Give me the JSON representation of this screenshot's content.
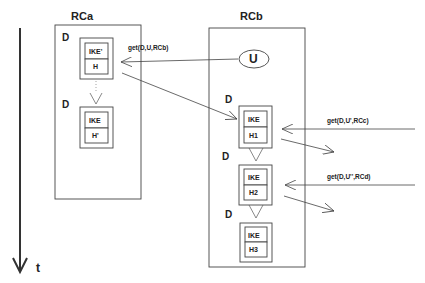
{
  "diagram": {
    "time_axis": {
      "label": "t"
    },
    "containers": [
      {
        "id": "RCa",
        "title": "RCa",
        "blocks": [
          {
            "d_label": "D",
            "top": "IKE'",
            "bottom": "H"
          },
          {
            "d_label": "D",
            "top": "IKE",
            "bottom": "H'"
          }
        ]
      },
      {
        "id": "RCb",
        "title": "RCb",
        "node": {
          "label": "U"
        },
        "blocks": [
          {
            "d_label": "D",
            "top": "IKE",
            "bottom": "H1"
          },
          {
            "d_label": "D",
            "top": "IKE",
            "bottom": "H2"
          },
          {
            "d_label": "D",
            "top": "IKE",
            "bottom": "H3"
          }
        ]
      }
    ],
    "messages": [
      {
        "label": "get(D,U,RCb)",
        "from": "U",
        "to": "RCa.H"
      },
      {
        "label": "get(D,U',RCc)",
        "from": "external",
        "to": "RCb.H1"
      },
      {
        "label": "get(D,U'',RCd)",
        "from": "external",
        "to": "RCb.H2"
      }
    ]
  }
}
